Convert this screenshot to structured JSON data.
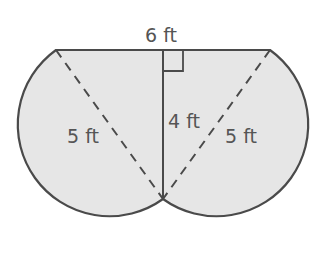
{
  "diagram": {
    "type": "composite-figure",
    "colors": {
      "fill": "#e6e6e6",
      "stroke": "#4a4a4a",
      "label": "#555555"
    },
    "labels": {
      "top": "6 ft",
      "height": "4 ft",
      "left_diagonal": "5 ft",
      "right_diagonal": "5 ft"
    },
    "geometry": {
      "top_left": [
        56,
        50
      ],
      "top_right": [
        270,
        50
      ],
      "bottom_vertex": [
        163,
        199
      ],
      "foot_of_height": [
        163,
        50
      ],
      "circle_radius_px": 91.7,
      "left_circle_center": [
        109.5,
        124.5
      ],
      "right_circle_center": [
        216.5,
        124.5
      ]
    }
  }
}
